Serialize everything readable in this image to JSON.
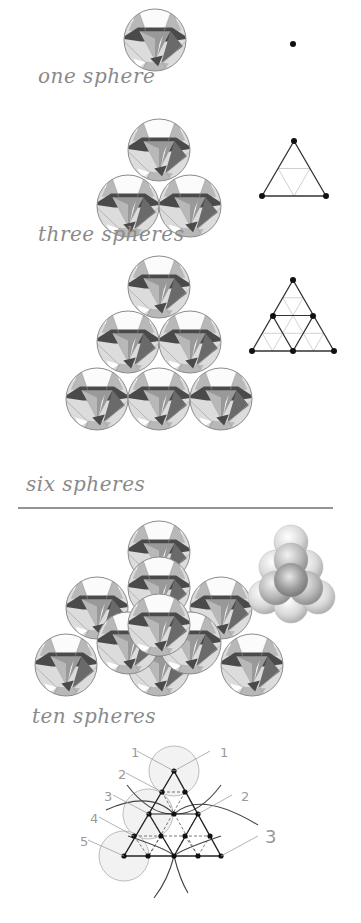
{
  "colors": {
    "background": "#ffffff",
    "sphere_outline": "#8c8c8c",
    "facet_white": "#fbfbfb",
    "facet_light": "#dcdcdc",
    "facet_mid": "#b8b8b8",
    "facet_gray": "#999999",
    "facet_dark": "#4a4a4a",
    "facet_darker": "#6a6a6a",
    "triangle_dark": "#333333",
    "triangle_light": "#c8c8c8",
    "dot": "#111111",
    "caption": "#8a8a8a",
    "divider": "#707070",
    "guide_circle_fill": "#f2f2f2",
    "guide_circle_stroke": "#bdbdbd",
    "label_gray": "#a0a0a0"
  },
  "captions": {
    "one": "one sphere",
    "three": "three spheres",
    "six": "six spheres",
    "ten": "ten spheres"
  },
  "sphere_radius": 31,
  "groups": {
    "one": {
      "spheres": [
        [
          155,
          40
        ]
      ]
    },
    "three": {
      "spheres": [
        [
          159,
          150
        ],
        [
          128,
          206
        ],
        [
          190,
          206
        ]
      ]
    },
    "six": {
      "spheres": [
        [
          159,
          287
        ],
        [
          128,
          342
        ],
        [
          190,
          342
        ],
        [
          97,
          399
        ],
        [
          159,
          399
        ],
        [
          221,
          399
        ]
      ]
    },
    "ten": {
      "spheres": [
        [
          159,
          552
        ],
        [
          97,
          608
        ],
        [
          221,
          608
        ],
        [
          66,
          665
        ],
        [
          159,
          665
        ],
        [
          252,
          665
        ],
        [
          159,
          588
        ],
        [
          128,
          643
        ],
        [
          190,
          643
        ],
        [
          159,
          625
        ]
      ]
    }
  },
  "triangles": {
    "one": {
      "dots": [
        [
          293,
          44
        ]
      ]
    },
    "three": {
      "outer": [
        [
          294,
          141
        ],
        [
          262,
          196
        ],
        [
          326,
          196
        ]
      ],
      "inner_light": [
        [
          294,
          169
        ],
        [
          310,
          168
        ],
        [
          278,
          168
        ]
      ],
      "dots": [
        [
          294,
          141
        ],
        [
          262,
          196
        ],
        [
          326,
          196
        ]
      ]
    },
    "six": {
      "outer": [
        [
          293,
          280
        ],
        [
          252,
          351
        ],
        [
          334,
          351
        ]
      ],
      "dots": [
        [
          293,
          280
        ],
        [
          273,
          316
        ],
        [
          313,
          316
        ],
        [
          252,
          351
        ],
        [
          293,
          351
        ],
        [
          334,
          351
        ]
      ]
    }
  },
  "small_pyramid": {
    "balls": [
      {
        "x": 265,
        "y": 597,
        "r": 17,
        "tone": "light"
      },
      {
        "x": 291,
        "y": 606,
        "r": 17,
        "tone": "light"
      },
      {
        "x": 318,
        "y": 597,
        "r": 17,
        "tone": "light"
      },
      {
        "x": 276,
        "y": 567,
        "r": 17,
        "tone": "light"
      },
      {
        "x": 306,
        "y": 567,
        "r": 17,
        "tone": "light"
      },
      {
        "x": 291,
        "y": 542,
        "r": 17,
        "tone": "light"
      },
      {
        "x": 276,
        "y": 588,
        "r": 17,
        "tone": "mid"
      },
      {
        "x": 306,
        "y": 588,
        "r": 17,
        "tone": "mid"
      },
      {
        "x": 291,
        "y": 560,
        "r": 17,
        "tone": "mid"
      },
      {
        "x": 291,
        "y": 580,
        "r": 17,
        "tone": "dark"
      }
    ]
  },
  "construction": {
    "dots": [
      [
        174,
        771
      ],
      [
        162,
        792
      ],
      [
        185,
        792
      ],
      [
        149,
        814
      ],
      [
        174,
        814
      ],
      [
        198,
        814
      ],
      [
        134,
        836
      ],
      [
        161,
        836
      ],
      [
        185,
        836
      ],
      [
        210,
        836
      ],
      [
        124,
        856
      ],
      [
        148,
        856
      ],
      [
        174,
        856
      ],
      [
        198,
        856
      ],
      [
        221,
        856
      ]
    ],
    "labels": [
      {
        "text": "1",
        "x": 131,
        "y": 757,
        "lx1": 137,
        "ly1": 751,
        "lx2": 174,
        "ly2": 771
      },
      {
        "text": "1",
        "x": 220,
        "y": 757,
        "lx1": 210,
        "ly1": 751,
        "lx2": 174,
        "ly2": 771
      },
      {
        "text": "2",
        "x": 118,
        "y": 779,
        "lx1": 126,
        "ly1": 773,
        "lx2": 162,
        "ly2": 792
      },
      {
        "text": "2",
        "x": 241,
        "y": 801,
        "lx1": 232,
        "ly1": 795,
        "lx2": 198,
        "ly2": 814
      },
      {
        "text": "3",
        "x": 104,
        "y": 801,
        "lx1": 113,
        "ly1": 795,
        "lx2": 149,
        "ly2": 814
      },
      {
        "text": "4",
        "x": 90,
        "y": 823,
        "lx1": 99,
        "ly1": 817,
        "lx2": 134,
        "ly2": 836
      },
      {
        "text": "5",
        "x": 80,
        "y": 846,
        "lx1": 88,
        "ly1": 840,
        "lx2": 124,
        "ly2": 856
      },
      {
        "text": "3",
        "x": 265,
        "y": 843,
        "lx1": 258,
        "ly1": 836,
        "lx2": 221,
        "ly2": 856
      }
    ]
  }
}
